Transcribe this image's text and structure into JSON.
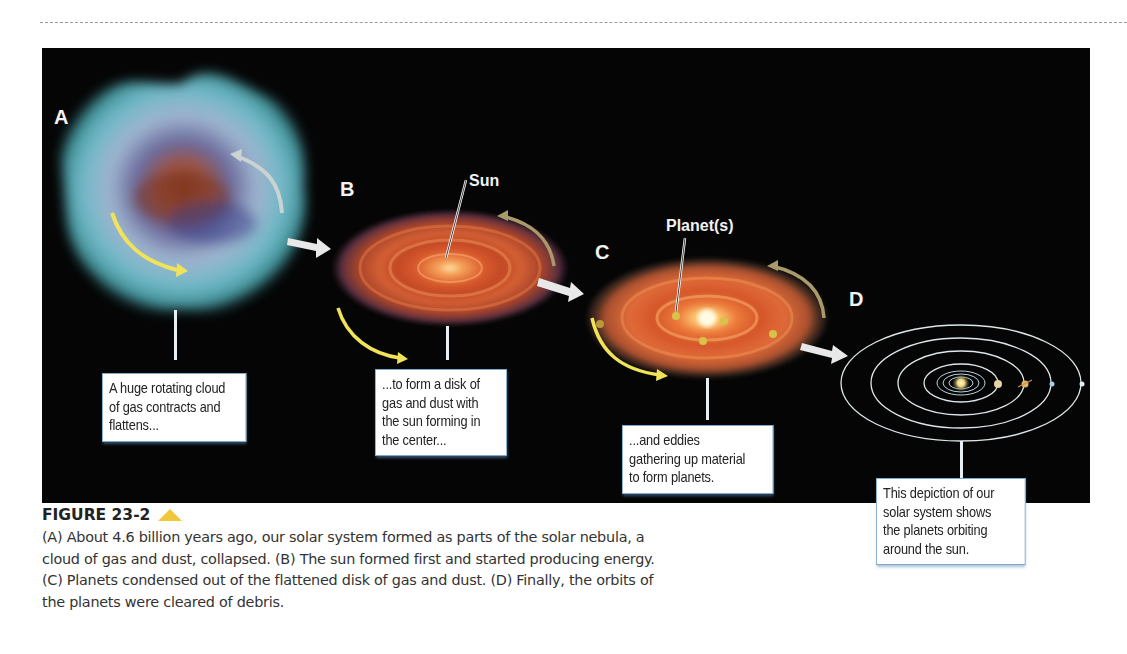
{
  "figure": {
    "number_label": "FIGURE 23-2",
    "marker_icon": "yellow-triangle-icon",
    "marker_color": "#f1c83a",
    "panel_background": "#050505",
    "stages": [
      {
        "letter": "A",
        "feature_label": "",
        "callout_lines": [
          "A huge rotating cloud",
          "of gas contracts and",
          "flattens..."
        ]
      },
      {
        "letter": "B",
        "feature_label": "Sun",
        "callout_lines": [
          "...to form a disk of",
          "gas and dust with",
          "the sun forming in",
          "the center..."
        ]
      },
      {
        "letter": "C",
        "feature_label": "Planet(s)",
        "callout_lines": [
          "...and eddies",
          "gathering up material",
          "to form planets."
        ]
      },
      {
        "letter": "D",
        "feature_label": "",
        "callout_lines": [
          "This depiction of our",
          "solar system shows",
          "the planets orbiting",
          "around the sun."
        ]
      }
    ],
    "caption_lines": [
      "(A) About 4.6 billion years ago, our solar system formed as parts of the solar nebula, a",
      "cloud of gas and dust, collapsed. (B) The sun formed first and started producing energy.",
      "(C) Planets condensed out of the flattened disk of gas and dust. (D) Finally, the orbits of",
      "the planets were cleared of debris."
    ]
  }
}
